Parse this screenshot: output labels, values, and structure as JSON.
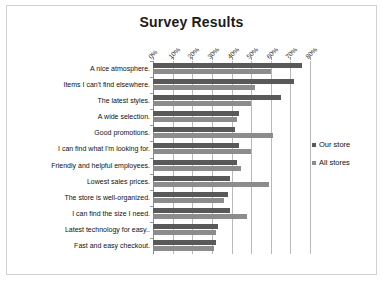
{
  "chart_data": {
    "type": "bar",
    "orientation": "horizontal",
    "title": "Survey Results",
    "xlabel": "",
    "ylabel": "",
    "xlim": [
      0,
      80
    ],
    "xticks": [
      "0%",
      "10%",
      "20%",
      "30%",
      "40%",
      "50%",
      "60%",
      "70%",
      "80%"
    ],
    "xtick_values": [
      0,
      10,
      20,
      30,
      40,
      50,
      60,
      70,
      80
    ],
    "grid": true,
    "legend_position": "right",
    "categories": [
      "A nice atmosphere.",
      "Items I can't find elsewhere.",
      "The latest styles.",
      "A wide selection.",
      "Good promotions.",
      "I can find what I'm looking for.",
      "Friendly and helpful employees.",
      "Lowest sales prices.",
      "The store is well-organized.",
      "I can find the size I need.",
      "Latest technology for easy..",
      "Fast and easy checkout."
    ],
    "series": [
      {
        "name": "Our store",
        "color": "#595959",
        "values": [
          76,
          72,
          65,
          44,
          42,
          44,
          43,
          39,
          38,
          39,
          33,
          32
        ]
      },
      {
        "name": "All stores",
        "color": "#8c8c8c",
        "values": [
          60,
          52,
          50,
          43,
          61,
          50,
          45,
          59,
          36,
          48,
          32,
          31
        ]
      }
    ]
  },
  "legend": {
    "items": [
      {
        "label": "Our store"
      },
      {
        "label": "All stores"
      }
    ]
  },
  "colors": {
    "our_store": "#595959",
    "all_stores": "#8c8c8c",
    "grid": "#b8b8b8",
    "border": "#d2d2d2",
    "text": "#111111"
  }
}
